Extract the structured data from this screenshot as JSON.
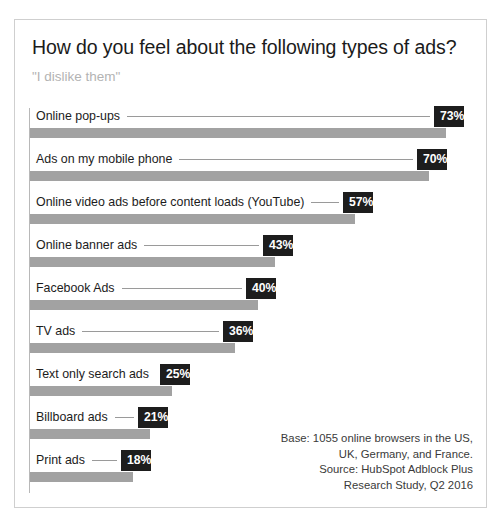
{
  "chart": {
    "title": "How do you feel about the following types of ads?",
    "subtitle": "\"I dislike them\""
  },
  "source": {
    "line1": "Base: 1055 online browsers in the US,",
    "line2": "UK, Germany, and France.",
    "line3": "Source: HubSpot Adblock Plus",
    "line4": "Research Study, Q2 2016"
  },
  "rows": [
    {
      "label": "Online pop-ups",
      "value": "73%"
    },
    {
      "label": "Ads on my mobile phone",
      "value": "70%"
    },
    {
      "label": "Online video ads before content loads (YouTube)",
      "value": "57%"
    },
    {
      "label": "Online banner ads",
      "value": "43%"
    },
    {
      "label": "Facebook Ads",
      "value": "40%"
    },
    {
      "label": "TV ads",
      "value": "36%"
    },
    {
      "label": "Text only search ads",
      "value": "25%"
    },
    {
      "label": "Billboard ads",
      "value": "21%"
    },
    {
      "label": "Print ads",
      "value": "18%"
    }
  ],
  "chart_data": {
    "type": "bar",
    "orientation": "horizontal",
    "title": "How do you feel about the following types of ads?",
    "subtitle": "\"I dislike them\"",
    "xlabel": "",
    "ylabel": "",
    "xlim": [
      0,
      73
    ],
    "grid": false,
    "legend": null,
    "value_suffix": "%",
    "bar_color": "#a2a2a2",
    "label_box_color": "#1d1d1d",
    "categories": [
      "Online pop-ups",
      "Ads on my mobile phone",
      "Online video ads before content loads (YouTube)",
      "Online banner ads",
      "Facebook Ads",
      "TV ads",
      "Text only search ads",
      "Billboard ads",
      "Print ads"
    ],
    "values": [
      73,
      70,
      57,
      43,
      40,
      36,
      25,
      21,
      18
    ],
    "annotations": [
      "Base: 1055 online browsers in the US, UK, Germany, and France.",
      "Source: HubSpot Adblock Plus Research Study, Q2 2016"
    ]
  }
}
